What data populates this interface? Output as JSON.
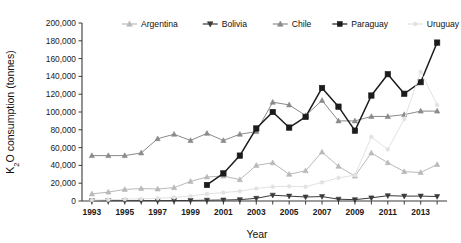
{
  "chart_data": {
    "type": "line",
    "title": "",
    "xlabel": "Year",
    "ylabel": "K2O consumption (tonnes)",
    "ylabel_rich": "K₂O consumption (tonnes)",
    "x": [
      1993,
      1994,
      1995,
      1996,
      1997,
      1998,
      1999,
      2000,
      2001,
      2002,
      2003,
      2004,
      2005,
      2006,
      2007,
      2008,
      2009,
      2010,
      2011,
      2012,
      2013,
      2014
    ],
    "xtick_labels": [
      "1993",
      "1995",
      "1997",
      "1999",
      "2001",
      "2003",
      "2005",
      "2007",
      "2009",
      "2011",
      "2013"
    ],
    "xtick_values": [
      1993,
      1995,
      1997,
      1999,
      2001,
      2003,
      2005,
      2007,
      2009,
      2011,
      2013
    ],
    "xlim": [
      1992.4,
      2014.6
    ],
    "ytick_labels": [
      "0",
      "20,000",
      "40,000",
      "60,000",
      "80,000",
      "100,000",
      "120,000",
      "140,000",
      "160,000",
      "180,000",
      "200,000"
    ],
    "ytick_values": [
      0,
      20000,
      40000,
      60000,
      80000,
      100000,
      120000,
      140000,
      160000,
      180000,
      200000
    ],
    "ylim": [
      0,
      200000
    ],
    "grid": false,
    "legend_position": "top-center",
    "series": [
      {
        "name": "Argentina",
        "color": "#b9b9b9",
        "marker": "triangle-up",
        "values": [
          8000,
          10000,
          13000,
          14000,
          13500,
          15000,
          22000,
          27000,
          28000,
          24000,
          40000,
          43000,
          30000,
          34000,
          55000,
          39000,
          28000,
          54000,
          43000,
          33000,
          32000,
          41000
        ]
      },
      {
        "name": "Bolivia",
        "color": "#3a3a3a",
        "marker": "triangle-down",
        "values": [
          300,
          300,
          300,
          400,
          400,
          500,
          600,
          900,
          1100,
          1500,
          3000,
          6500,
          5500,
          4500,
          5000,
          2000,
          1500,
          3500,
          6000,
          5500,
          5500,
          5000
        ]
      },
      {
        "name": "Chile",
        "color": "#8a8a8a",
        "marker": "triangle-up",
        "values": [
          51000,
          51000,
          51000,
          54000,
          70000,
          75000,
          68000,
          76000,
          68000,
          75000,
          78000,
          111000,
          108000,
          96000,
          113000,
          90000,
          90000,
          95000,
          95000,
          97000,
          101000,
          101000
        ]
      },
      {
        "name": "Paraguay",
        "color": "#1c1c1c",
        "marker": "square",
        "values": [
          null,
          null,
          null,
          null,
          null,
          null,
          null,
          18000,
          31000,
          51000,
          81500,
          100000,
          82500,
          94500,
          127000,
          106000,
          79000,
          118500,
          142500,
          120500,
          133500,
          178000
        ]
      },
      {
        "name": "Uruguay",
        "color": "#e2e2e2",
        "marker": "circle",
        "values": [
          1000,
          1500,
          2000,
          2500,
          3000,
          4000,
          5500,
          8000,
          9500,
          11000,
          14000,
          16000,
          16500,
          16000,
          21000,
          26000,
          29000,
          72000,
          58000,
          92000,
          145000,
          108000
        ]
      }
    ]
  }
}
